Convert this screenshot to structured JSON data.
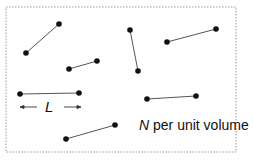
{
  "diagram": {
    "box": {
      "x": 6,
      "y": 7,
      "width": 230,
      "height": 145,
      "stroke": "#888888",
      "style": "dotted"
    },
    "dumbbells": [
      {
        "x1": 26,
        "y1": 53,
        "x2": 59,
        "y2": 24
      },
      {
        "x1": 130,
        "y1": 30,
        "x2": 138,
        "y2": 71
      },
      {
        "x1": 167,
        "y1": 42,
        "x2": 216,
        "y2": 29
      },
      {
        "x1": 69,
        "y1": 69,
        "x2": 97,
        "y2": 61
      },
      {
        "x1": 20,
        "y1": 94,
        "x2": 79,
        "y2": 93
      },
      {
        "x1": 147,
        "y1": 99,
        "x2": 196,
        "y2": 96
      },
      {
        "x1": 66,
        "y1": 139,
        "x2": 115,
        "y2": 125
      }
    ],
    "length_label": "L",
    "density_label_var": "N",
    "density_label_text": " per unit volume",
    "colors": {
      "ball": "#111111",
      "rod": "#555555",
      "arrow": "#333333"
    }
  }
}
